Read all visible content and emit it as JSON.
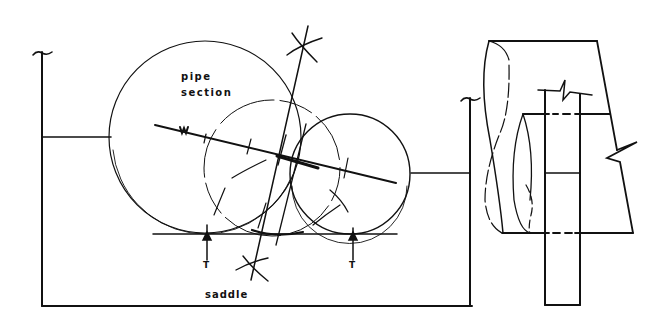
{
  "diagram": {
    "type": "engineering-sketch",
    "stroke_color": "#111111",
    "background": "#ffffff",
    "labels": {
      "pipe_line1": "pipe",
      "pipe_line2": "section",
      "weight": "W",
      "thrust_left": "T",
      "thrust_right": "T",
      "saddle": "saddle"
    },
    "elements": {
      "large_circle": {
        "cx": 205,
        "cy": 137,
        "r": 96
      },
      "small_circle": {
        "cx": 350,
        "cy": 174,
        "r": 60
      },
      "construction_circle": {
        "cx": 272,
        "cy": 168,
        "r": 68
      },
      "base_line_y": 234,
      "saddle_frame": {
        "left_x": 42,
        "right_x": 470,
        "bottom_y": 306,
        "left_top_y": 52,
        "right_top_y": 98
      }
    }
  }
}
